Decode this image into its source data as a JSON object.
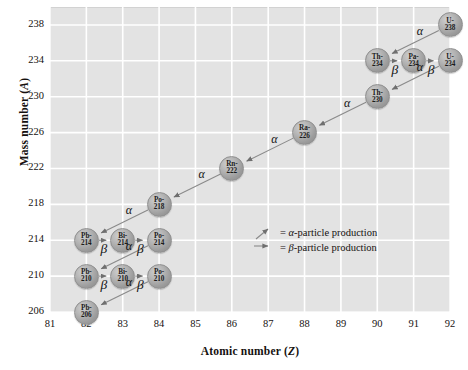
{
  "chart_data": {
    "type": "scatter",
    "title": "",
    "xlabel": "Atomic number (Z)",
    "ylabel": "Mass number (A)",
    "xlim": [
      80.5,
      92.5
    ],
    "ylim": [
      204,
      240
    ],
    "xticks": [
      81,
      82,
      83,
      84,
      85,
      86,
      87,
      88,
      89,
      90,
      91,
      92
    ],
    "yticks": [
      206,
      210,
      214,
      218,
      222,
      226,
      230,
      234,
      238
    ],
    "grid": true,
    "legend_position": "inside-center-right",
    "nodes": [
      {
        "symbol": "U-",
        "mass": "238",
        "element": "U",
        "z": 92,
        "a": 238
      },
      {
        "symbol": "Th-",
        "mass": "234",
        "element": "Th",
        "z": 90,
        "a": 234
      },
      {
        "symbol": "Pa-",
        "mass": "234",
        "element": "Pa",
        "z": 91,
        "a": 234
      },
      {
        "symbol": "U-",
        "mass": "234",
        "element": "U",
        "z": 92,
        "a": 234
      },
      {
        "symbol": "Th-",
        "mass": "230",
        "element": "Th",
        "z": 90,
        "a": 230
      },
      {
        "symbol": "Ra-",
        "mass": "226",
        "element": "Ra",
        "z": 88,
        "a": 226
      },
      {
        "symbol": "Rn-",
        "mass": "222",
        "element": "Rn",
        "z": 86,
        "a": 222
      },
      {
        "symbol": "Po-",
        "mass": "218",
        "element": "Po",
        "z": 84,
        "a": 218
      },
      {
        "symbol": "Pb-",
        "mass": "214",
        "element": "Pb",
        "z": 82,
        "a": 214
      },
      {
        "symbol": "Bi-",
        "mass": "214",
        "element": "Bi",
        "z": 83,
        "a": 214
      },
      {
        "symbol": "Po-",
        "mass": "214",
        "element": "Po",
        "z": 84,
        "a": 214
      },
      {
        "symbol": "Pb-",
        "mass": "210",
        "element": "Pb",
        "z": 82,
        "a": 210
      },
      {
        "symbol": "Bi-",
        "mass": "210",
        "element": "Bi",
        "z": 83,
        "a": 210
      },
      {
        "symbol": "Po-",
        "mass": "210",
        "element": "Po",
        "z": 84,
        "a": 210
      },
      {
        "symbol": "Pb-",
        "mass": "206",
        "element": "Pb",
        "z": 82,
        "a": 206
      }
    ],
    "decays": [
      {
        "from": [
          92,
          238
        ],
        "to": [
          90,
          234
        ],
        "type": "alpha",
        "label": "α"
      },
      {
        "from": [
          90,
          234
        ],
        "to": [
          91,
          234
        ],
        "type": "beta",
        "label": "β"
      },
      {
        "from": [
          91,
          234
        ],
        "to": [
          92,
          234
        ],
        "type": "beta",
        "label": "β"
      },
      {
        "from": [
          92,
          234
        ],
        "to": [
          90,
          230
        ],
        "type": "alpha",
        "label": "α"
      },
      {
        "from": [
          90,
          230
        ],
        "to": [
          88,
          226
        ],
        "type": "alpha",
        "label": "α"
      },
      {
        "from": [
          88,
          226
        ],
        "to": [
          86,
          222
        ],
        "type": "alpha",
        "label": "α"
      },
      {
        "from": [
          86,
          222
        ],
        "to": [
          84,
          218
        ],
        "type": "alpha",
        "label": "α"
      },
      {
        "from": [
          84,
          218
        ],
        "to": [
          82,
          214
        ],
        "type": "alpha",
        "label": "α"
      },
      {
        "from": [
          82,
          214
        ],
        "to": [
          83,
          214
        ],
        "type": "beta",
        "label": "β"
      },
      {
        "from": [
          83,
          214
        ],
        "to": [
          84,
          214
        ],
        "type": "beta",
        "label": "β"
      },
      {
        "from": [
          84,
          214
        ],
        "to": [
          82,
          210
        ],
        "type": "alpha",
        "label": "α"
      },
      {
        "from": [
          82,
          210
        ],
        "to": [
          83,
          210
        ],
        "type": "beta",
        "label": "β"
      },
      {
        "from": [
          83,
          210
        ],
        "to": [
          84,
          210
        ],
        "type": "beta",
        "label": "β"
      },
      {
        "from": [
          84,
          210
        ],
        "to": [
          82,
          206
        ],
        "type": "alpha",
        "label": "α"
      }
    ],
    "legend": [
      {
        "glyph": "diagonal-line",
        "text": "= α-particle production"
      },
      {
        "glyph": "right-arrow",
        "text": "= β-particle production"
      }
    ]
  },
  "axes": {
    "x": {
      "label": "Atomic number (Z)",
      "label_main": "Atomic number (",
      "label_var": "Z",
      "label_end": ")",
      "ticks": [
        "81",
        "82",
        "83",
        "84",
        "85",
        "86",
        "87",
        "88",
        "89",
        "90",
        "91",
        "92"
      ]
    },
    "y": {
      "label": "Mass number (A)",
      "label_main": "Mass number (",
      "label_var": "A",
      "label_end": ")",
      "ticks": [
        "238",
        "234",
        "230",
        "226",
        "222",
        "218",
        "214",
        "210",
        "206"
      ]
    }
  },
  "legend": {
    "alpha_text_pre": "= ",
    "alpha_symbol": "α",
    "alpha_text_post": "-particle production",
    "beta_text_pre": "= ",
    "beta_symbol": "β",
    "beta_text_post": "-particle production"
  },
  "colors": {
    "plot_background": "#e3e3e3",
    "gridline": "#ffffff",
    "node_fill": "#a8a8a8",
    "arrow": "#8f8f8f",
    "text": "#15110f"
  }
}
